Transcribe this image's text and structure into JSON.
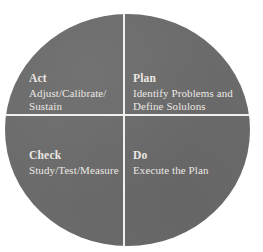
{
  "figure": {
    "name": "pdca-cycle-diagram",
    "shape": "circle",
    "circle_color": "#6b6b6b",
    "divider_color": "#f2f0ec",
    "text_color": "#ebe8e3",
    "background_color": "#ffffff"
  },
  "quadrants": [
    {
      "id": "act",
      "position": "top-left",
      "title": "Act",
      "lines": [
        "Adjust/Calibrate/",
        "Sustain"
      ]
    },
    {
      "id": "plan",
      "position": "top-right",
      "title": "Plan",
      "lines": [
        "Identify Problems and",
        "Define Solulons"
      ]
    },
    {
      "id": "check",
      "position": "bottom-left",
      "title": "Check",
      "lines": [
        "Study/Test/Measure"
      ]
    },
    {
      "id": "do",
      "position": "bottom-right",
      "title": "Do",
      "lines": [
        "Execute the Plan"
      ]
    }
  ]
}
